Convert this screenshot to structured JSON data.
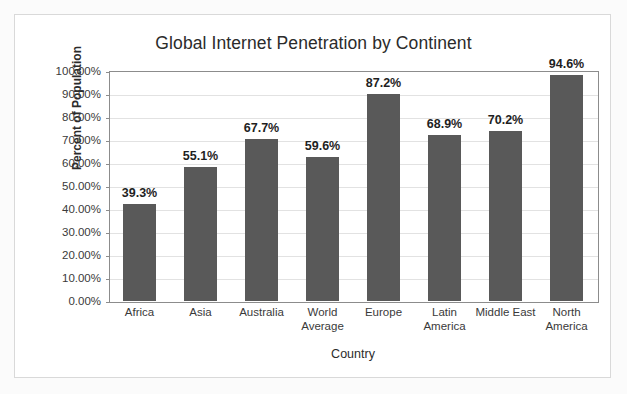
{
  "chart_data": {
    "type": "bar",
    "title": "Global Internet Penetration by Continent",
    "xlabel": "Country",
    "ylabel": "Percent of Population",
    "ylim": [
      0,
      100
    ],
    "grid": true,
    "legend": "none",
    "y_ticks": [
      "100.00%",
      "90.00%",
      "80.00%",
      "70.00%",
      "60.00%",
      "50.00%",
      "40.00%",
      "30.00%",
      "20.00%",
      "10.00%",
      "0.00%"
    ],
    "y_tick_values": [
      100,
      90,
      80,
      70,
      60,
      50,
      40,
      30,
      20,
      10,
      0
    ],
    "categories": [
      "Africa",
      "Asia",
      "Australia",
      "World Average",
      "Europe",
      "Latin America",
      "Middle East",
      "North America"
    ],
    "values": [
      39.3,
      55.1,
      67.7,
      59.6,
      87.2,
      68.9,
      70.2,
      94.6
    ],
    "data_labels": [
      "39.3%",
      "55.1%",
      "67.7%",
      "59.6%",
      "87.2%",
      "68.9%",
      "70.2%",
      "94.6%"
    ],
    "plotted_heights": [
      42.0,
      58.3,
      70.6,
      62.7,
      90.2,
      72.3,
      73.9,
      98.1
    ],
    "category_lines": [
      [
        "Africa"
      ],
      [
        "Asia"
      ],
      [
        "Australia"
      ],
      [
        "World",
        "Average"
      ],
      [
        "Europe"
      ],
      [
        "Latin",
        "America"
      ],
      [
        "Middle East"
      ],
      [
        "North",
        "America"
      ]
    ],
    "bar_color": "#595959",
    "gridline_color": "#e2e2e2",
    "axis_color": "#8c8c8c",
    "plot_background": "#ffffff"
  }
}
